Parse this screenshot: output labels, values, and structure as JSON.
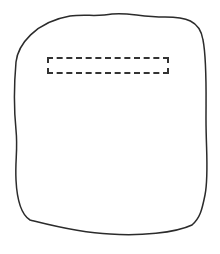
{
  "sketch": {
    "outline": {
      "stroke_color": "#2b2b2b",
      "fill_color": "#ffffff"
    },
    "field": {
      "text": "",
      "border_color": "#333333",
      "border_style": "dashed"
    }
  }
}
